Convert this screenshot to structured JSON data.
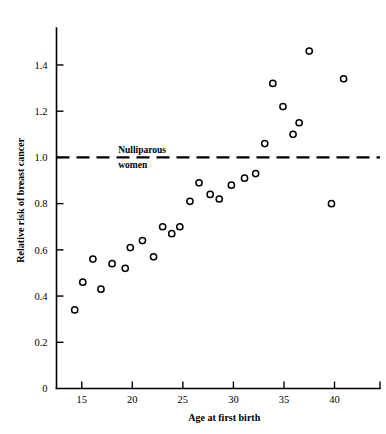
{
  "chart_data": {
    "type": "scatter",
    "title": "",
    "xlabel": "Age at first birth",
    "ylabel": "Relative risk of breast cancer",
    "xlim": [
      12.5,
      44.5
    ],
    "ylim": [
      0,
      1.56
    ],
    "grid": false,
    "legend": "none",
    "xticks": [
      "15",
      "20",
      "25",
      "30",
      "35",
      "40"
    ],
    "xtick_values": [
      15,
      20,
      25,
      30,
      35,
      40
    ],
    "yticks": [
      "0",
      "0.2",
      "0.4",
      "0.6",
      "0.8",
      "1.0",
      "1.2",
      "1.4"
    ],
    "ytick_values": [
      0,
      0.2,
      0.4,
      0.6,
      0.8,
      1.0,
      1.2,
      1.4
    ],
    "annotations": [
      {
        "name": "nulliparous-reference",
        "line1": "Nulliparous",
        "line2": "women",
        "y_value": 1.0,
        "style": "dashed-horizontal-line"
      }
    ],
    "series": [
      {
        "name": "Relative risk by age at first birth",
        "marker": "open-circle",
        "points": [
          {
            "x": 14.3,
            "y": 0.34
          },
          {
            "x": 15.1,
            "y": 0.46
          },
          {
            "x": 16.1,
            "y": 0.56
          },
          {
            "x": 16.9,
            "y": 0.43
          },
          {
            "x": 18.0,
            "y": 0.54
          },
          {
            "x": 19.3,
            "y": 0.52
          },
          {
            "x": 19.8,
            "y": 0.61
          },
          {
            "x": 21.0,
            "y": 0.64
          },
          {
            "x": 22.1,
            "y": 0.57
          },
          {
            "x": 23.0,
            "y": 0.7
          },
          {
            "x": 23.9,
            "y": 0.67
          },
          {
            "x": 24.7,
            "y": 0.7
          },
          {
            "x": 25.7,
            "y": 0.81
          },
          {
            "x": 26.6,
            "y": 0.89
          },
          {
            "x": 27.7,
            "y": 0.84
          },
          {
            "x": 28.6,
            "y": 0.82
          },
          {
            "x": 29.8,
            "y": 0.88
          },
          {
            "x": 31.1,
            "y": 0.91
          },
          {
            "x": 32.2,
            "y": 0.93
          },
          {
            "x": 33.1,
            "y": 1.06
          },
          {
            "x": 33.9,
            "y": 1.32
          },
          {
            "x": 34.9,
            "y": 1.22
          },
          {
            "x": 35.9,
            "y": 1.1
          },
          {
            "x": 36.5,
            "y": 1.15
          },
          {
            "x": 37.5,
            "y": 1.46
          },
          {
            "x": 39.7,
            "y": 0.8
          },
          {
            "x": 40.9,
            "y": 1.34
          }
        ]
      }
    ]
  },
  "colors": {
    "axis": "#000000",
    "marker_stroke": "#000000",
    "marker_fill": "#ffffff",
    "reference_line": "#000000",
    "background": "#ffffff"
  }
}
